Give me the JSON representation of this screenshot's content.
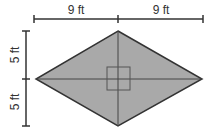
{
  "diagram": {
    "shape": "rhombus",
    "fill": "#a9a9a9",
    "stroke": "#333333",
    "labels": {
      "top_left": "9 ft",
      "top_right": "9 ft",
      "left_top": "5 ft",
      "left_bottom": "5 ft"
    },
    "right_angle_marker": true
  }
}
